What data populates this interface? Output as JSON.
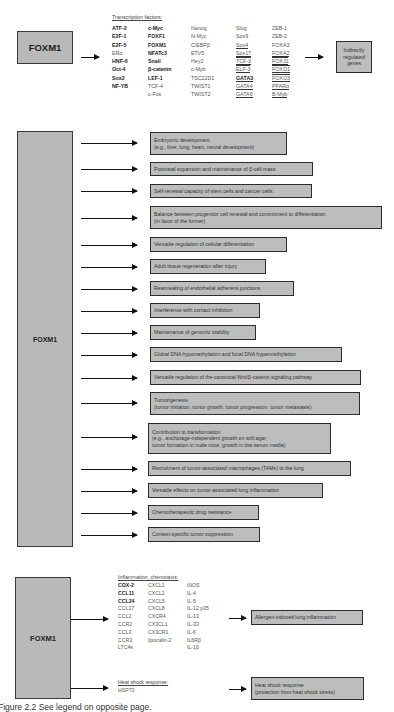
{
  "section_top": {
    "source_label": "FOXM1",
    "list_header": "Transcription factors:",
    "columns": [
      [
        {
          "text": "ATF-2",
          "bold": true
        },
        {
          "text": "E2F-1",
          "bold": true
        },
        {
          "text": "E2F-5",
          "bold": true
        },
        {
          "text": "ERα",
          "bold": false
        },
        {
          "text": "HNF-6",
          "bold": true
        },
        {
          "text": "Oct-4",
          "bold": true
        },
        {
          "text": "Sox2",
          "bold": true
        },
        {
          "text": "NF-YB",
          "bold": true
        }
      ],
      [
        {
          "text": "c-Myc",
          "bold": true
        },
        {
          "text": "FOXF1",
          "bold": true
        },
        {
          "text": "FOXM1",
          "bold": true
        },
        {
          "text": "NFATc3",
          "bold": true
        },
        {
          "text": "Snail",
          "bold": true
        },
        {
          "text": "β-catenin",
          "bold": true
        },
        {
          "text": "LEF-1",
          "bold": true
        },
        {
          "text": "TCF-4",
          "bold": false
        },
        {
          "text": "c-Fos",
          "bold": false
        }
      ],
      [
        {
          "text": "Nanog"
        },
        {
          "text": "N-Myc"
        },
        {
          "text": "C/EBPβ"
        },
        {
          "text": "ETV5"
        },
        {
          "text": "Hey2"
        },
        {
          "text": "c-Myb"
        },
        {
          "text": "TSC22D1"
        },
        {
          "text": "TWIST1"
        },
        {
          "text": "TWIST2"
        }
      ],
      [
        {
          "text": "Slug",
          "underline": false
        },
        {
          "text": "Sox9",
          "underline": false
        },
        {
          "text": "Sox4",
          "underline": true
        },
        {
          "text": "Sox17",
          "underline": true
        },
        {
          "text": "TCF-3",
          "underline": true
        },
        {
          "text": "ELF-3",
          "underline": true
        },
        {
          "text": "GATA3",
          "underline": true,
          "bold": true
        },
        {
          "text": "GATA4",
          "underline": true
        },
        {
          "text": "GATA6",
          "underline": true
        }
      ],
      [
        {
          "text": "ZEB-1",
          "underline": false
        },
        {
          "text": "ZEB-2",
          "underline": false
        },
        {
          "text": "FOXA3",
          "underline": false
        },
        {
          "text": "FOXA2",
          "underline": true
        },
        {
          "text": "FOXJ1",
          "underline": true
        },
        {
          "text": "FOXO1",
          "underline": true
        },
        {
          "text": "FOXO3",
          "underline": true
        },
        {
          "text": "PPARα",
          "underline": true
        },
        {
          "text": "B-Myb",
          "underline": true
        }
      ]
    ],
    "target_label": "Indirectly regulated genes"
  },
  "section_middle": {
    "source_label": "FOXM1",
    "outcomes": [
      {
        "line1": "Embryonic development",
        "line2": "(e.g., liver, lung, heart, neural development)"
      },
      {
        "line1": "Postnatal expansion and maintenance of β-cell mass"
      },
      {
        "line1": "Self-renewal capacity of stem cells and cancer cells"
      },
      {
        "line1": "Balance between progenitor cell renewal and commitment to differentiation",
        "line2": "(in favor of the former)"
      },
      {
        "line1": "Versatile regulation of cellular differentiation"
      },
      {
        "line1": "Adult tissue regeneration after injury"
      },
      {
        "line1": "Reannealing of endothelial adherens junctions"
      },
      {
        "line1": "Interference with contact inhibition"
      },
      {
        "line1": "Maintenance of genomic stability"
      },
      {
        "line1": "Global DNA hypomethylation and focal DNA hypermethylation"
      },
      {
        "line1": "Versatile regulation of the canonical Wnt/β-catenin signaling pathway"
      },
      {
        "line1": "Tumorigenesis",
        "line2": "(tumor initiation, tumor growth, tumor progression, tumor metastasis)"
      },
      {
        "line1": "Contribution to transformation",
        "line2": "(e.g., anchorage-independent growth on soft agar,",
        "line3": "tumor formation in nude mice, growth in low serum media)"
      },
      {
        "line1": "Recruitment of tumor-associated macrophages (TAMs) to the lung"
      },
      {
        "line1": "Versatile effects on tumor-associated lung inflammation"
      },
      {
        "line1": "Chemotherapeutic drug resistance"
      },
      {
        "line1": "Context-specific tumor suppression"
      }
    ]
  },
  "section_bottom": {
    "source_label": "FOXM1",
    "inflammation": {
      "header": "Inflammation, chemotaxis:",
      "columns": [
        [
          {
            "text": "COX-2",
            "bold": true
          },
          {
            "text": "CCL11",
            "bold": true
          },
          {
            "text": "CCL24",
            "bold": true
          },
          {
            "text": "CCL17"
          },
          {
            "text": "CCL2"
          },
          {
            "text": "CCR2"
          },
          {
            "text": "CCL3"
          },
          {
            "text": "CCR3"
          },
          {
            "text": "LTC4s"
          }
        ],
        [
          {
            "text": "CXCL1"
          },
          {
            "text": "CXCL2"
          },
          {
            "text": "CXCL5"
          },
          {
            "text": "CXCL8"
          },
          {
            "text": "CXCR4"
          },
          {
            "text": "CX3CL1"
          },
          {
            "text": "CX3CR1"
          },
          {
            "text": "lipocalin-2"
          }
        ],
        [
          {
            "text": "iNOS"
          },
          {
            "text": "IL-4"
          },
          {
            "text": "IL-5"
          },
          {
            "text": "IL-12 p35"
          },
          {
            "text": "IL-13"
          },
          {
            "text": "IL-33"
          },
          {
            "text": "IL-6"
          },
          {
            "text": "IL6Rβ"
          },
          {
            "text": "IL-1β"
          }
        ]
      ],
      "outcome": "Allergen-induced lung inflammation"
    },
    "heat_shock": {
      "header": "Heat shock response:",
      "item": "HSP70",
      "outcome_line1": "Heat shock response",
      "outcome_line2": "(protection from heat shock stress)"
    }
  },
  "caption": "Figure 2.2  See legend on opposite page."
}
